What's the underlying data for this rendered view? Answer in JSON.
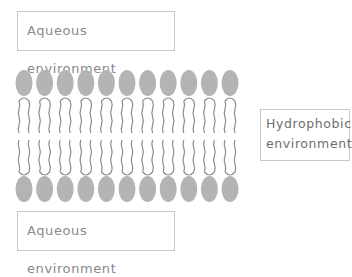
{
  "diagram": {
    "labels": {
      "top": "Aqueous environment",
      "bottom": "Aqueous environment",
      "side_line1": "Hydrophobic",
      "side_line2": "environment"
    },
    "lipid_count_per_leaflet": 11,
    "colors": {
      "head": "#b4b4b4",
      "tail": "#8c8c8c",
      "box_border": "#c8c8c8",
      "text": "#8a8a8a"
    }
  }
}
